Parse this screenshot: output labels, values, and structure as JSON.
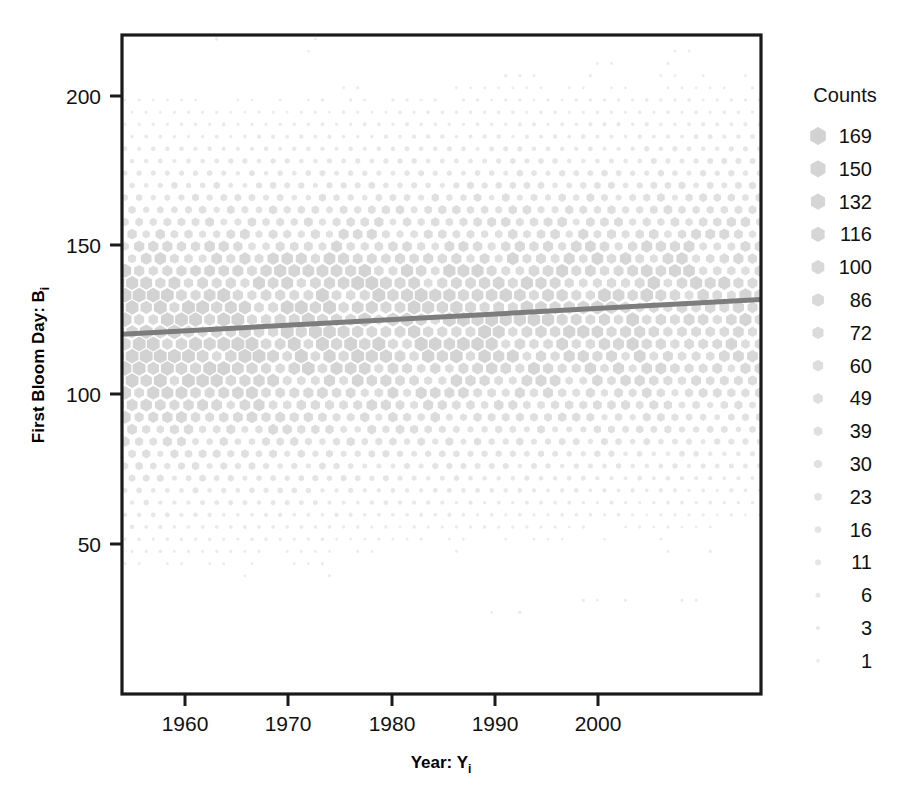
{
  "chart_data": {
    "type": "scatter",
    "subtype": "hexbin",
    "title": "",
    "xlabel": "Year: Y",
    "xlabel_sub": "i",
    "ylabel": "First Bloom Day: B",
    "ylabel_sub": "i",
    "xlim": [
      1955.2,
      2003.8
    ],
    "ylim": [
      5,
      216
    ],
    "xticks": [
      1960,
      1970,
      1980,
      1990,
      2000
    ],
    "xtick_labels": [
      "1960",
      "1970",
      "1980",
      "1990",
      "2000"
    ],
    "yticks": [
      50,
      100,
      150,
      200
    ],
    "ytick_labels": [
      "50",
      "100",
      "150",
      "200"
    ],
    "grid": false,
    "frame": true,
    "legend": {
      "title": "Counts",
      "position": "right",
      "entries": [
        169,
        150,
        132,
        116,
        100,
        86,
        72,
        60,
        49,
        39,
        30,
        23,
        16,
        11,
        6,
        3,
        1
      ],
      "entry_labels": [
        "169",
        "150",
        "132",
        "116",
        "100",
        "86",
        "72",
        "60",
        "49",
        "39",
        "30",
        "23",
        "16",
        "11",
        "6",
        "3",
        "1"
      ]
    },
    "trend_line": {
      "type": "linear-regression",
      "x_start": 1955.2,
      "y_start": 120.2,
      "x_end": 2003.8,
      "y_end": 131.3,
      "color": "#7d7d7d"
    },
    "marker_color": "#d9d9d9",
    "series_note": "hexagonal binned density of first bloom day versus year"
  },
  "colors": {
    "axis": "#1a1a1a",
    "marker": "#d9d9d9",
    "trend": "#7d7d7d",
    "background": "#ffffff",
    "text": "#111111"
  }
}
